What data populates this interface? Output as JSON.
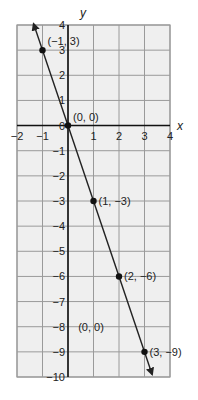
{
  "chart_data": {
    "type": "line",
    "title": "",
    "xlabel": "x",
    "ylabel": "y",
    "xlim": [
      -2,
      4
    ],
    "ylim": [
      -10,
      4
    ],
    "grid": true,
    "x_ticks": [
      "-2",
      "-1",
      "0",
      "1",
      "2",
      "3",
      "4"
    ],
    "y_ticks": [
      "4",
      "3",
      "2",
      "1",
      "0",
      "-1",
      "-2",
      "-3",
      "-4",
      "-5",
      "-6",
      "-7",
      "-8",
      "-9",
      "-10"
    ],
    "series": [
      {
        "name": "y = -3x",
        "x": [
          -1,
          0,
          1,
          2,
          3
        ],
        "y": [
          3,
          0,
          -3,
          -6,
          -9
        ],
        "arrows_both_ends": true
      }
    ],
    "points": [
      {
        "x": -1,
        "y": 3,
        "label": "(−1, 3)"
      },
      {
        "x": 0,
        "y": 0,
        "label": "(0, 0)"
      },
      {
        "x": 1,
        "y": -3,
        "label": "(1, −3)"
      },
      {
        "x": 2,
        "y": -6,
        "label": "(2, −6)"
      },
      {
        "x": 3,
        "y": -9,
        "label": "(3, −9)"
      }
    ],
    "annotations": [
      {
        "x": 0.4,
        "y": -8,
        "text": "(0, 0)"
      }
    ]
  },
  "colors": {
    "grid_bg": "#efefef",
    "grid_line": "#9a9a9a",
    "axis": "#111111",
    "line": "#222222"
  }
}
